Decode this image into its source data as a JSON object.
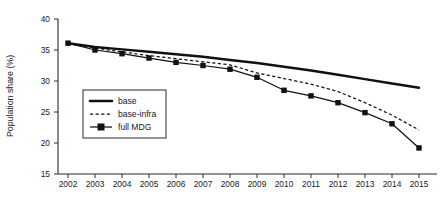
{
  "chart_data": {
    "type": "line",
    "title": "",
    "xlabel": "",
    "ylabel": "Population share (%)",
    "x": [
      2002,
      2003,
      2004,
      2005,
      2006,
      2007,
      2008,
      2009,
      2010,
      2011,
      2012,
      2013,
      2014,
      2015
    ],
    "xtick_labels": [
      "2002",
      "2003",
      "2004",
      "2005",
      "2006",
      "2007",
      "2008",
      "2009",
      "2010",
      "2011",
      "2012",
      "2013",
      "2014",
      "2015"
    ],
    "ytick_labels": [
      "15",
      "20",
      "25",
      "30",
      "35",
      "40"
    ],
    "yticks": [
      15,
      20,
      25,
      30,
      35,
      40
    ],
    "xlim": [
      2002,
      2015
    ],
    "ylim": [
      15,
      40
    ],
    "grid": false,
    "legend_position": "center-left-inside",
    "series": [
      {
        "name": "base",
        "style": "solid-thick",
        "marker": "none",
        "color": "#111111",
        "values": [
          36.1,
          35.5,
          35.1,
          34.7,
          34.3,
          33.9,
          33.4,
          32.9,
          32.3,
          31.7,
          31.0,
          30.3,
          29.6,
          28.9
        ]
      },
      {
        "name": "base-infra",
        "style": "dashed",
        "marker": "none",
        "color": "#111111",
        "values": [
          36.1,
          35.3,
          34.7,
          34.1,
          33.6,
          33.1,
          32.6,
          31.3,
          30.4,
          29.5,
          28.3,
          26.5,
          24.5,
          22.1
        ]
      },
      {
        "name": "full MDG",
        "style": "solid-marker",
        "marker": "square",
        "color": "#111111",
        "values": [
          36.1,
          35.0,
          34.4,
          33.7,
          33.0,
          32.5,
          31.9,
          30.6,
          28.5,
          27.6,
          26.5,
          24.9,
          23.1,
          19.2
        ]
      }
    ]
  },
  "legend": {
    "entries": [
      {
        "label": "base"
      },
      {
        "label": "base-infra"
      },
      {
        "label": "full MDG"
      }
    ]
  },
  "colors": {
    "ink": "#111111",
    "axis": "#2b2b2b",
    "background": "#ffffff"
  }
}
